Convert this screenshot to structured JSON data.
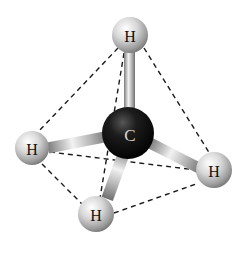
{
  "molecule": {
    "name": "methane",
    "geometry": "tetrahedral",
    "central_atom": {
      "label": "C",
      "color": "#111111"
    },
    "atoms": [
      {
        "id": "h_top",
        "label": "H"
      },
      {
        "id": "h_left",
        "label": "H"
      },
      {
        "id": "h_right",
        "label": "H"
      },
      {
        "id": "h_bottom",
        "label": "H"
      }
    ]
  },
  "colors": {
    "hydrogen": "#d0d0d0",
    "carbon": "#111111",
    "bond": "#a8a8a8",
    "dashed_edge": "#1a1a1a",
    "background": "#ffffff"
  }
}
